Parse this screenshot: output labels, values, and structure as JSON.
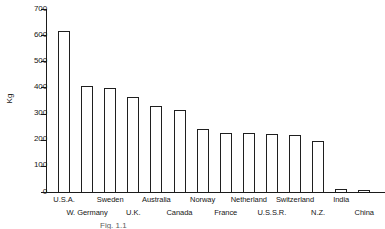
{
  "figure": {
    "caption": "Fig. 1.1"
  },
  "chart_data": {
    "type": "bar",
    "title": "",
    "xlabel": "",
    "ylabel": "Kg",
    "ylim": [
      0,
      700
    ],
    "yticks": [
      0,
      100,
      200,
      300,
      400,
      500,
      600,
      700
    ],
    "ytick_labels": [
      "0",
      "100",
      "200",
      "300",
      "400",
      "500",
      "600",
      "700"
    ],
    "grid": false,
    "legend": null,
    "bar_style": {
      "fill": "#ffffff",
      "edge": "#1f1f1f"
    },
    "categories": [
      "U.S.A.",
      "W. Germany",
      "Sweden",
      "U.K.",
      "Australia",
      "Canada",
      "Norway",
      "France",
      "Netherland",
      "U.S.S.R.",
      "Switzerland",
      "N.Z.",
      "India",
      "China"
    ],
    "values": [
      617,
      406,
      398,
      364,
      330,
      314,
      241,
      226,
      226,
      222,
      218,
      195,
      10,
      4
    ],
    "label_rows": [
      0,
      1,
      0,
      1,
      0,
      1,
      0,
      1,
      0,
      1,
      0,
      1,
      0,
      1
    ]
  }
}
